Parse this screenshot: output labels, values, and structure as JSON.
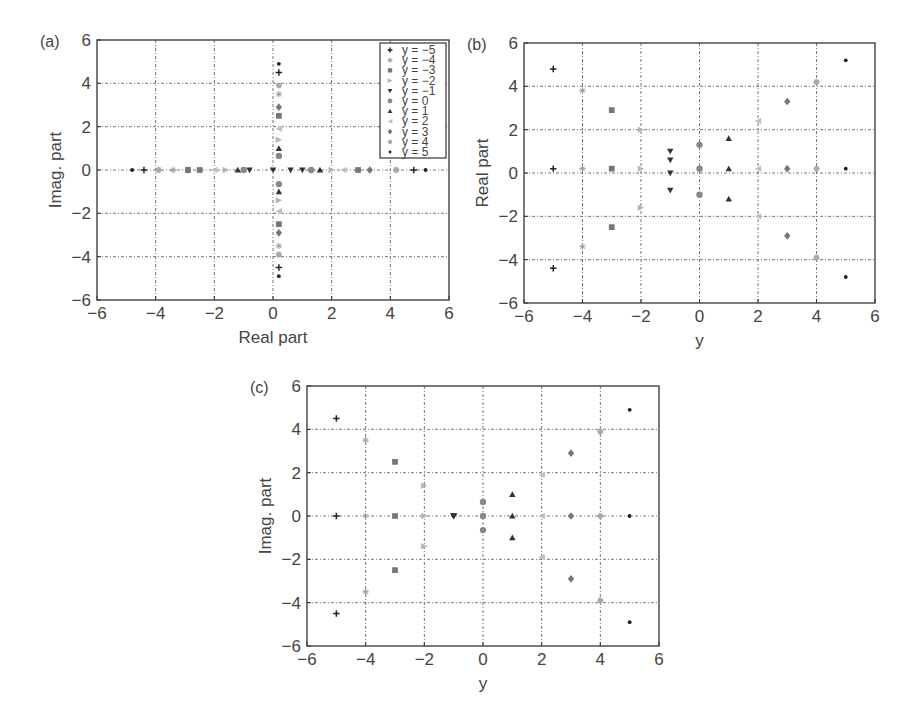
{
  "chart_data": [
    {
      "panel": "(a)",
      "type": "scatter",
      "title": "",
      "xlabel": "Real part",
      "ylabel": "Imag. part",
      "xlim": [
        -6,
        6
      ],
      "ylim": [
        -6,
        6
      ],
      "xticks": [
        -6,
        -4,
        -2,
        0,
        2,
        4,
        6
      ],
      "yticks": [
        -6,
        -4,
        -2,
        0,
        2,
        4,
        6
      ],
      "grid": true,
      "legend_position": "upper right",
      "series": [
        {
          "name": "y = -5",
          "marker": "plus",
          "color": "#222222",
          "points": [
            [
              -4.4,
              0
            ],
            [
              0.2,
              4.5
            ],
            [
              0.2,
              -4.5
            ],
            [
              4.8,
              0
            ]
          ]
        },
        {
          "name": "y = -4",
          "marker": "star",
          "color": "#9a9a9a",
          "points": [
            [
              -3.4,
              0
            ],
            [
              -3.9,
              0
            ],
            [
              0.2,
              3.5
            ],
            [
              0.2,
              -3.5
            ],
            [
              4.2,
              0
            ]
          ]
        },
        {
          "name": "y = -3",
          "marker": "square",
          "color": "#777777",
          "points": [
            [
              -2.5,
              0
            ],
            [
              -2.9,
              0
            ],
            [
              0.2,
              2.5
            ],
            [
              0.2,
              -2.5
            ],
            [
              2.9,
              0
            ]
          ]
        },
        {
          "name": "y = -2",
          "marker": "triangle-right",
          "color": "#b5b5b5",
          "points": [
            [
              -1.6,
              0
            ],
            [
              0.2,
              1.4
            ],
            [
              0.2,
              -1.4
            ],
            [
              2.0,
              0
            ]
          ]
        },
        {
          "name": "y = -1",
          "marker": "triangle-down",
          "color": "#333333",
          "points": [
            [
              -0.8,
              0
            ],
            [
              0,
              0
            ],
            [
              0.6,
              0
            ],
            [
              1.0,
              0
            ]
          ]
        },
        {
          "name": "y = 0",
          "marker": "circle",
          "color": "#888888",
          "points": [
            [
              -1.0,
              0
            ],
            [
              0.2,
              0.65
            ],
            [
              0.2,
              -0.65
            ],
            [
              1.3,
              0
            ]
          ]
        },
        {
          "name": "y = 1",
          "marker": "triangle-up",
          "color": "#333333",
          "points": [
            [
              -1.2,
              0
            ],
            [
              0.2,
              1.0
            ],
            [
              0.2,
              -1.0
            ],
            [
              1.6,
              0
            ]
          ]
        },
        {
          "name": "y = 2",
          "marker": "triangle-left",
          "color": "#c0c0c0",
          "points": [
            [
              -2.0,
              0
            ],
            [
              0.2,
              1.9
            ],
            [
              0.2,
              -1.9
            ],
            [
              2.4,
              0
            ]
          ]
        },
        {
          "name": "y = 3",
          "marker": "diamond",
          "color": "#777777",
          "points": [
            [
              -2.9,
              0
            ],
            [
              0.2,
              2.9
            ],
            [
              0.2,
              -2.9
            ],
            [
              3.3,
              0
            ]
          ]
        },
        {
          "name": "y = 4",
          "marker": "hexagon",
          "color": "#aaaaaa",
          "points": [
            [
              -3.9,
              0
            ],
            [
              0.2,
              3.9
            ],
            [
              0.2,
              -3.9
            ],
            [
              4.2,
              0
            ]
          ]
        },
        {
          "name": "y = 5",
          "marker": "dot",
          "color": "#222222",
          "points": [
            [
              -4.8,
              0
            ],
            [
              0.2,
              4.9
            ],
            [
              0.2,
              -4.9
            ],
            [
              5.2,
              0
            ]
          ]
        }
      ]
    },
    {
      "panel": "(b)",
      "type": "scatter",
      "title": "",
      "xlabel": "y",
      "ylabel": "Real part",
      "xlim": [
        -6,
        6
      ],
      "ylim": [
        -6,
        6
      ],
      "xticks": [
        -6,
        -4,
        -2,
        0,
        2,
        4,
        6
      ],
      "yticks": [
        -6,
        -4,
        -2,
        0,
        2,
        4,
        6
      ],
      "grid": true,
      "series": [
        {
          "name": "y = -5",
          "marker": "plus",
          "color": "#222222",
          "points": [
            [
              -5,
              4.8
            ],
            [
              -5,
              0.2
            ],
            [
              -5,
              -4.4
            ]
          ]
        },
        {
          "name": "y = -4",
          "marker": "star",
          "color": "#9a9a9a",
          "points": [
            [
              -4,
              3.8
            ],
            [
              -4,
              0.2
            ],
            [
              -4,
              -3.4
            ]
          ]
        },
        {
          "name": "y = -3",
          "marker": "square",
          "color": "#777777",
          "points": [
            [
              -3,
              2.9
            ],
            [
              -3,
              0.2
            ],
            [
              -3,
              -2.5
            ]
          ]
        },
        {
          "name": "y = -2",
          "marker": "triangle-right",
          "color": "#b5b5b5",
          "points": [
            [
              -2,
              2.0
            ],
            [
              -2,
              0.2
            ],
            [
              -2,
              -1.6
            ]
          ]
        },
        {
          "name": "y = -1",
          "marker": "triangle-down",
          "color": "#333333",
          "points": [
            [
              -1,
              1.0
            ],
            [
              -1,
              0.6
            ],
            [
              -1,
              0
            ],
            [
              -1,
              -0.8
            ]
          ]
        },
        {
          "name": "y = 0",
          "marker": "circle",
          "color": "#888888",
          "points": [
            [
              0,
              1.3
            ],
            [
              0,
              0.2
            ],
            [
              0,
              -1.0
            ]
          ]
        },
        {
          "name": "y = 1",
          "marker": "triangle-up",
          "color": "#333333",
          "points": [
            [
              1,
              1.6
            ],
            [
              1,
              0.2
            ],
            [
              1,
              -1.2
            ]
          ]
        },
        {
          "name": "y = 2",
          "marker": "triangle-left",
          "color": "#c0c0c0",
          "points": [
            [
              2,
              2.4
            ],
            [
              2,
              0.2
            ],
            [
              2,
              -2.0
            ]
          ]
        },
        {
          "name": "y = 3",
          "marker": "diamond",
          "color": "#777777",
          "points": [
            [
              3,
              3.3
            ],
            [
              3,
              0.2
            ],
            [
              3,
              -2.9
            ]
          ]
        },
        {
          "name": "y = 4",
          "marker": "hexagon",
          "color": "#aaaaaa",
          "points": [
            [
              4,
              4.2
            ],
            [
              4,
              0.2
            ],
            [
              4,
              -3.9
            ]
          ]
        },
        {
          "name": "y = 5",
          "marker": "dot",
          "color": "#222222",
          "points": [
            [
              5,
              5.2
            ],
            [
              5,
              0.2
            ],
            [
              5,
              -4.8
            ]
          ]
        }
      ]
    },
    {
      "panel": "(c)",
      "type": "scatter",
      "title": "",
      "xlabel": "y",
      "ylabel": "Imag. part",
      "xlim": [
        -6,
        6
      ],
      "ylim": [
        -6,
        6
      ],
      "xticks": [
        -6,
        -4,
        -2,
        0,
        2,
        4,
        6
      ],
      "yticks": [
        -6,
        -4,
        -2,
        0,
        2,
        4,
        6
      ],
      "grid": true,
      "series": [
        {
          "name": "y = -5",
          "marker": "plus",
          "color": "#222222",
          "points": [
            [
              -5,
              4.5
            ],
            [
              -5,
              0
            ],
            [
              -5,
              -4.5
            ]
          ]
        },
        {
          "name": "y = -4",
          "marker": "star",
          "color": "#9a9a9a",
          "points": [
            [
              -4,
              3.5
            ],
            [
              -4,
              0
            ],
            [
              -4,
              -3.5
            ]
          ]
        },
        {
          "name": "y = -3",
          "marker": "square",
          "color": "#777777",
          "points": [
            [
              -3,
              2.5
            ],
            [
              -3,
              0
            ],
            [
              -3,
              -2.5
            ]
          ]
        },
        {
          "name": "y = -2",
          "marker": "triangle-right",
          "color": "#b5b5b5",
          "points": [
            [
              -2,
              1.4
            ],
            [
              -2,
              0
            ],
            [
              -2,
              -1.4
            ]
          ]
        },
        {
          "name": "y = -1",
          "marker": "triangle-down",
          "color": "#333333",
          "points": [
            [
              -1,
              0
            ],
            [
              -1,
              0
            ],
            [
              -1,
              0
            ],
            [
              -1,
              0
            ]
          ]
        },
        {
          "name": "y = 0",
          "marker": "circle",
          "color": "#888888",
          "points": [
            [
              0,
              0.65
            ],
            [
              0,
              0
            ],
            [
              0,
              -0.65
            ]
          ]
        },
        {
          "name": "y = 1",
          "marker": "triangle-up",
          "color": "#333333",
          "points": [
            [
              1,
              1.0
            ],
            [
              1,
              0
            ],
            [
              1,
              -1.0
            ]
          ]
        },
        {
          "name": "y = 2",
          "marker": "triangle-left",
          "color": "#c0c0c0",
          "points": [
            [
              2,
              1.9
            ],
            [
              2,
              0
            ],
            [
              2,
              -1.9
            ]
          ]
        },
        {
          "name": "y = 3",
          "marker": "diamond",
          "color": "#777777",
          "points": [
            [
              3,
              2.9
            ],
            [
              3,
              0
            ],
            [
              3,
              -2.9
            ]
          ]
        },
        {
          "name": "y = 4",
          "marker": "hexagon",
          "color": "#aaaaaa",
          "points": [
            [
              4,
              3.9
            ],
            [
              4,
              0
            ],
            [
              4,
              -3.9
            ]
          ]
        },
        {
          "name": "y = 5",
          "marker": "dot",
          "color": "#222222",
          "points": [
            [
              5,
              4.9
            ],
            [
              5,
              0
            ],
            [
              5,
              -4.9
            ]
          ]
        }
      ]
    }
  ],
  "layout": {
    "panels": [
      {
        "id": "a",
        "letter": "(a)",
        "box": {
          "x0": 97,
          "x1": 449,
          "y0": 40,
          "y1": 300
        },
        "legend": true
      },
      {
        "id": "b",
        "letter": "(b)",
        "box": {
          "x0": 524,
          "x1": 875,
          "y0": 43,
          "y1": 303
        },
        "legend": false
      },
      {
        "id": "c",
        "letter": "(c)",
        "box": {
          "x0": 307,
          "x1": 659,
          "y0": 386,
          "y1": 646
        },
        "legend": false
      }
    ]
  }
}
